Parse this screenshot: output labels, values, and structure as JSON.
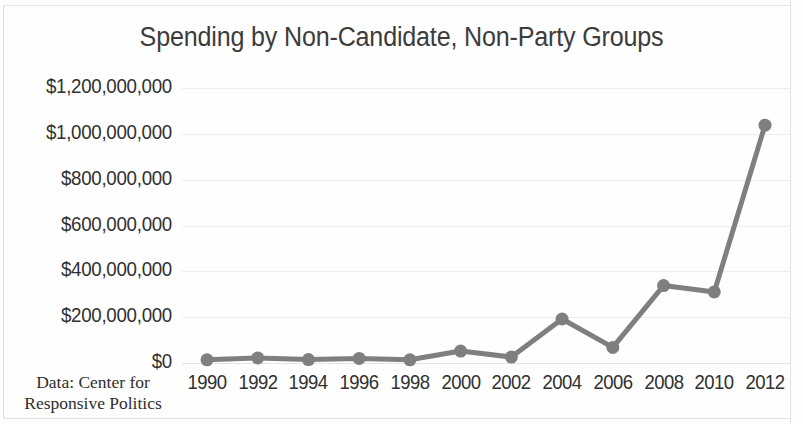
{
  "figure": {
    "title": "Spending by Non-Candidate, Non-Party Groups",
    "source_note_line1": "Data: Center for",
    "source_note_line2": "Responsive Politics"
  },
  "style": {
    "series_color": "#7f7f7f",
    "title_color": "#3c3c3c",
    "tick_color": "#313131",
    "gridline_color": "#ededed",
    "background_color": "#ffffff"
  },
  "chart_data": {
    "type": "line",
    "title": "Spending by Non-Candidate, Non-Party Groups",
    "xlabel": "",
    "ylabel": "",
    "categories": [
      "1990",
      "1992",
      "1994",
      "1996",
      "1998",
      "2000",
      "2002",
      "2004",
      "2006",
      "2008",
      "2010",
      "2012"
    ],
    "x": [
      1990,
      1992,
      1994,
      1996,
      1998,
      2000,
      2002,
      2004,
      2006,
      2008,
      2010,
      2012
    ],
    "series": [
      {
        "name": "Spending by non-candidate, non-party groups",
        "values": [
          14000000,
          22000000,
          15000000,
          20000000,
          14000000,
          52000000,
          26000000,
          192000000,
          68000000,
          338000000,
          310000000,
          1038000000
        ]
      }
    ],
    "ylim": [
      0,
      1200000000
    ],
    "ytick_values": [
      0,
      200000000,
      400000000,
      600000000,
      800000000,
      1000000000,
      1200000000
    ],
    "ytick_labels": [
      "$0",
      "$200,000,000",
      "$400,000,000",
      "$600,000,000",
      "$800,000,000",
      "$1,000,000,000",
      "$1,200,000,000"
    ],
    "grid": true,
    "grid_axis": "y",
    "legend": false,
    "markers": true,
    "annotations": [
      "Data: Center for Responsive Politics"
    ]
  }
}
